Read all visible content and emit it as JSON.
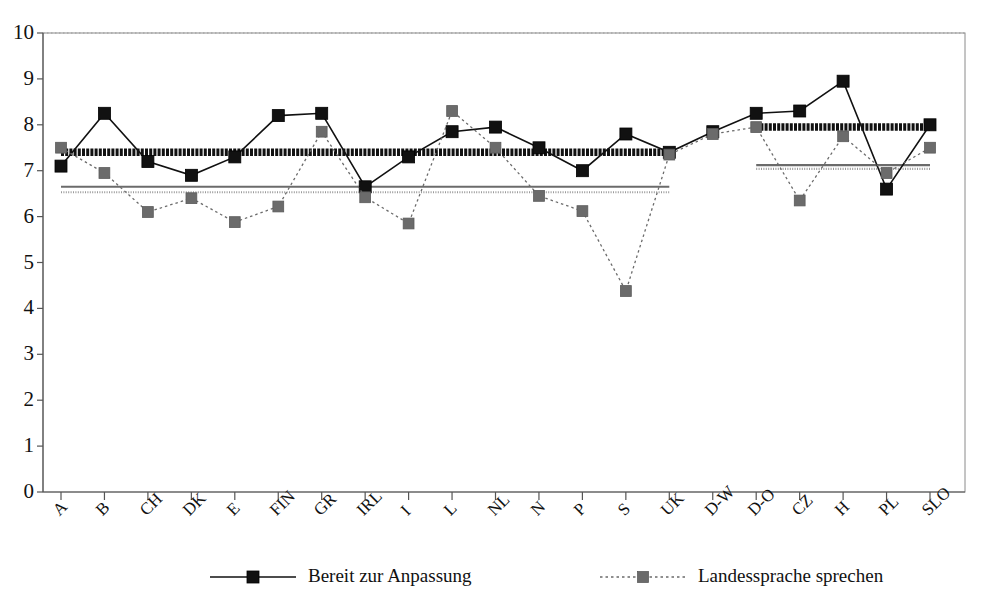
{
  "chart_data": {
    "type": "line",
    "title": "",
    "xlabel": "",
    "ylabel": "",
    "ylim": [
      0,
      10
    ],
    "ytick_step": 1,
    "grid": false,
    "legend_position": "bottom",
    "categories": [
      "A",
      "B",
      "CH",
      "DK",
      "E",
      "FIN",
      "GR",
      "IRL",
      "I",
      "L",
      "NL",
      "N",
      "P",
      "S",
      "UK",
      "D-W",
      "D-O",
      "CZ",
      "H",
      "PL",
      "SLO"
    ],
    "yticks": [
      "0",
      "1",
      "2",
      "3",
      "4",
      "5",
      "6",
      "7",
      "8",
      "9",
      "10"
    ],
    "series": [
      {
        "name": "Bereit zur Anpassung",
        "marker": "square",
        "color": "#111111",
        "line_style": "solid",
        "values": [
          7.1,
          8.25,
          7.2,
          6.9,
          7.3,
          8.2,
          8.25,
          6.65,
          7.3,
          7.85,
          7.95,
          7.5,
          7.0,
          7.8,
          7.4,
          7.85,
          8.25,
          8.3,
          8.95,
          6.6,
          8.0
        ]
      },
      {
        "name": "Landessprache sprechen",
        "marker": "square",
        "color": "#6b6b6b",
        "line_style": "dotted",
        "values": [
          7.5,
          6.95,
          6.1,
          6.4,
          5.88,
          6.22,
          7.85,
          6.42,
          5.85,
          8.3,
          7.5,
          6.45,
          6.12,
          4.38,
          7.35,
          7.8,
          7.95,
          6.35,
          7.75,
          6.95,
          7.5
        ]
      }
    ],
    "reference_lines": [
      {
        "name": "mean-anpassung-west",
        "value": 7.4,
        "from_category": "A",
        "to_category": "UK",
        "style": "thick-solid",
        "color": "#111111"
      },
      {
        "name": "mean-anpassung-east",
        "value": 7.95,
        "from_category": "D-O",
        "to_category": "SLO",
        "style": "thick-solid",
        "color": "#111111"
      },
      {
        "name": "mean-sprache-west-a",
        "value": 6.65,
        "from_category": "A",
        "to_category": "UK",
        "style": "thin-solid",
        "color": "#6b6b6b"
      },
      {
        "name": "mean-sprache-west-b",
        "value": 6.53,
        "from_category": "A",
        "to_category": "UK",
        "style": "thin-dotted",
        "color": "#9a9a9a"
      },
      {
        "name": "mean-sprache-east-a",
        "value": 7.12,
        "from_category": "D-O",
        "to_category": "SLO",
        "style": "thin-solid",
        "color": "#6b6b6b"
      },
      {
        "name": "mean-sprache-east-b",
        "value": 7.04,
        "from_category": "D-O",
        "to_category": "SLO",
        "style": "thin-dotted",
        "color": "#9a9a9a"
      }
    ]
  },
  "legend": {
    "items": [
      {
        "label": "Bereit zur Anpassung",
        "marker": "square-dark",
        "line": "solid"
      },
      {
        "label": "Landessprache sprechen",
        "marker": "square-gray",
        "line": "dotted"
      }
    ]
  },
  "colors": {
    "series_1": "#111111",
    "series_2": "#6b6b6b",
    "axis": "#555555",
    "border": "#7a7a7a",
    "background": "#ffffff"
  }
}
